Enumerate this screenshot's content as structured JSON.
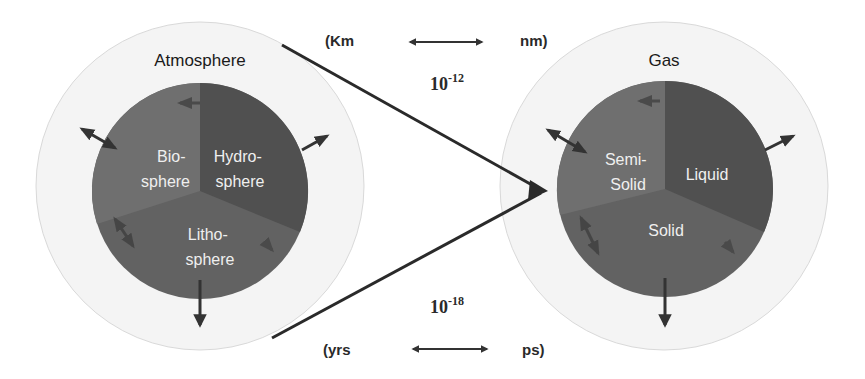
{
  "left_system": {
    "outer_label": "Atmosphere",
    "segments": {
      "top_left": [
        "Bio-",
        "sphere"
      ],
      "top_right": [
        "Hydro-",
        "sphere"
      ],
      "bottom": [
        "Litho-",
        "sphere"
      ]
    }
  },
  "right_system": {
    "outer_label": "Gas",
    "segments": {
      "top_left": [
        "Semi-",
        "Solid"
      ],
      "top_right": [
        "Liquid"
      ],
      "bottom": [
        "Solid"
      ]
    }
  },
  "scale_top": {
    "left": "(Km",
    "right": "nm)",
    "factor_base": "10",
    "factor_exp": "-12"
  },
  "scale_bottom": {
    "left": "(yrs",
    "right": "ps)",
    "factor_base": "10",
    "factor_exp": "-18"
  },
  "colors": {
    "outer_ring": "#f4f4f4",
    "outer_ring_stroke": "#d6d6d6",
    "segment_left": "#6e6e6e",
    "segment_right": "#555555",
    "segment_bottom": "#626262",
    "arrow": "#333333",
    "inner_text": "#f0f0f0"
  }
}
